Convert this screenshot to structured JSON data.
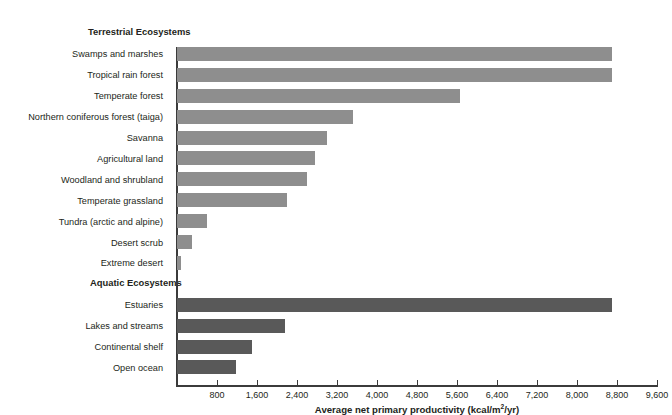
{
  "chart_data": {
    "type": "bar",
    "orientation": "horizontal",
    "title": "",
    "xlabel": "Average net primary productivity (kcal/m2/yr)",
    "xlabel_display": "Average net primary productivity (kcal/m",
    "xlabel_sup": "2",
    "xlabel_tail": "/yr)",
    "ylabel": "",
    "xlim": [
      0,
      9600
    ],
    "grid": false,
    "legend": "none",
    "xticks": [
      800,
      1600,
      2400,
      3200,
      4000,
      4800,
      5600,
      6400,
      7200,
      8000,
      8800,
      9600
    ],
    "xtick_labels": [
      "800",
      "1,600",
      "2,400",
      "3,200",
      "4,000",
      "4,800",
      "5,600",
      "6,400",
      "7,200",
      "8,000",
      "8,800",
      "9,600"
    ],
    "groups": [
      {
        "name": "Terrestrial Ecosystems",
        "color": "#8e8e8e",
        "categories": [
          "Swamps and marshes",
          "Tropical rain forest",
          "Temperate forest",
          "Northern coniferous forest (taiga)",
          "Savanna",
          "Agricultural land",
          "Woodland and shrubland",
          "Temperate grassland",
          "Tundra (arctic and alpine)",
          "Desert scrub",
          "Extreme desert"
        ],
        "values": [
          8700,
          8700,
          5660,
          3520,
          3000,
          2760,
          2600,
          2200,
          600,
          300,
          70
        ]
      },
      {
        "name": "Aquatic Ecosystems",
        "color": "#595959",
        "categories": [
          "Estuaries",
          "Lakes and streams",
          "Continental shelf",
          "Open ocean"
        ],
        "values": [
          8700,
          2160,
          1500,
          1180
        ]
      }
    ],
    "colors": {
      "terrestrial_bar": "#8e8e8e",
      "aquatic_bar": "#595959",
      "axis": "#3b3b3b",
      "text": "#231f20",
      "background": "#ffffff"
    }
  }
}
